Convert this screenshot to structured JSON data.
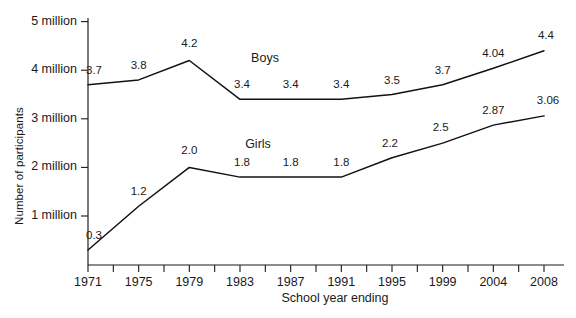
{
  "chart_data": {
    "type": "line",
    "title": "",
    "xlabel": "School year ending",
    "ylabel": "Number of participants",
    "x": [
      1971,
      1975,
      1979,
      1983,
      1987,
      1991,
      1995,
      1999,
      2004,
      2008
    ],
    "categories": [
      "1971",
      "1975",
      "1979",
      "1983",
      "1987",
      "1991",
      "1995",
      "1999",
      "2004",
      "2008"
    ],
    "xlim": [
      1971,
      2008
    ],
    "ylim": [
      0,
      5
    ],
    "y_unit": "million",
    "grid": false,
    "legend_position": "inline-annotation",
    "y_ticks": [
      {
        "value": 1,
        "label": "1 million"
      },
      {
        "value": 2,
        "label": "2 million"
      },
      {
        "value": 3,
        "label": "3 million"
      },
      {
        "value": 4,
        "label": "4 million"
      },
      {
        "value": 5,
        "label": "5 million"
      }
    ],
    "x_minor_tick_count": 19,
    "series": [
      {
        "name": "Boys",
        "values": [
          3.7,
          3.8,
          4.2,
          3.4,
          3.4,
          3.4,
          3.5,
          3.7,
          4.04,
          4.4
        ],
        "point_labels": [
          "3.7",
          "3.8",
          "4.2",
          "3.4",
          "3.4",
          "3.4",
          "3.5",
          "3.7",
          "4.04",
          "4.4"
        ],
        "annotation": "Boys"
      },
      {
        "name": "Girls",
        "values": [
          0.3,
          1.2,
          2.0,
          1.8,
          1.8,
          1.8,
          2.2,
          2.5,
          2.87,
          3.06
        ],
        "point_labels": [
          "0.3",
          "1.2",
          "2.0",
          "1.8",
          "1.8",
          "1.8",
          "2.2",
          "2.5",
          "2.87",
          "3.06"
        ],
        "annotation": "Girls"
      }
    ],
    "colors": {
      "line": "#111111",
      "axis": "#1a1a1a",
      "text": "#1a1a1a",
      "background": "#ffffff"
    }
  },
  "axes": {
    "x_title": "School year ending",
    "y_title": "Number of participants"
  },
  "annotations": {
    "boys": "Boys",
    "girls": "Girls"
  }
}
